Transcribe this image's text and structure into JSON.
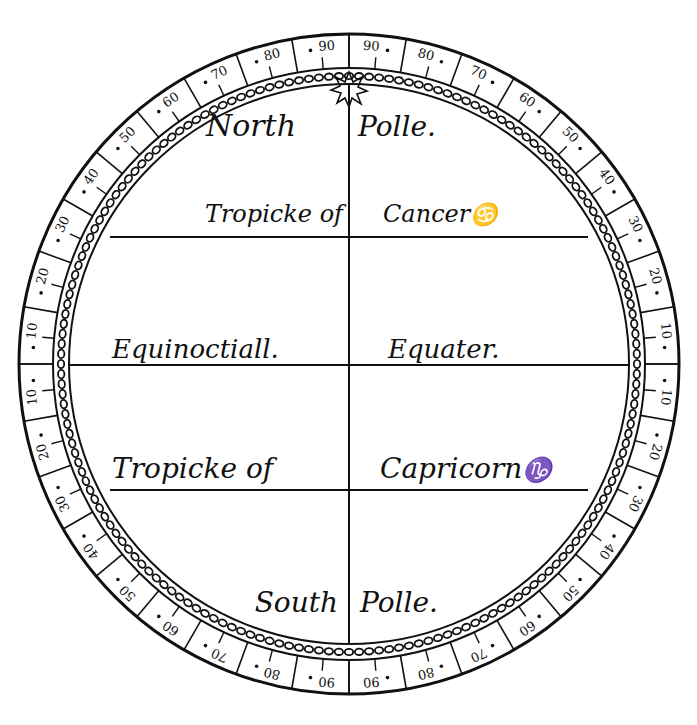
{
  "diagram": {
    "ink_color": "#111111",
    "paper_color": "#ffffff",
    "labels": {
      "north_pole_left": "North",
      "north_pole_right": "Polle.",
      "tropic_cancer_left": "Tropicke of",
      "tropic_cancer_right": "Cancer",
      "cancer_symbol": "♋",
      "equinoctial_left": "Equinoctiall.",
      "equinoctial_right": "Equater.",
      "tropic_capricorn_left": "Tropicke of",
      "tropic_capricorn_right": "Capricorn",
      "capricorn_symbol": "♑",
      "south_pole_left": "South",
      "south_pole_right": "Polle."
    },
    "pole_star_icon": "star-icon",
    "scale": {
      "description": "Degree scale around rim, 0 at equator, 90 at each pole, labelled every 10 degrees in each quadrant",
      "quadrant_labels": [
        "10",
        "20",
        "30",
        "40",
        "50",
        "60",
        "70",
        "80",
        "90"
      ],
      "equator_label": "0"
    }
  }
}
